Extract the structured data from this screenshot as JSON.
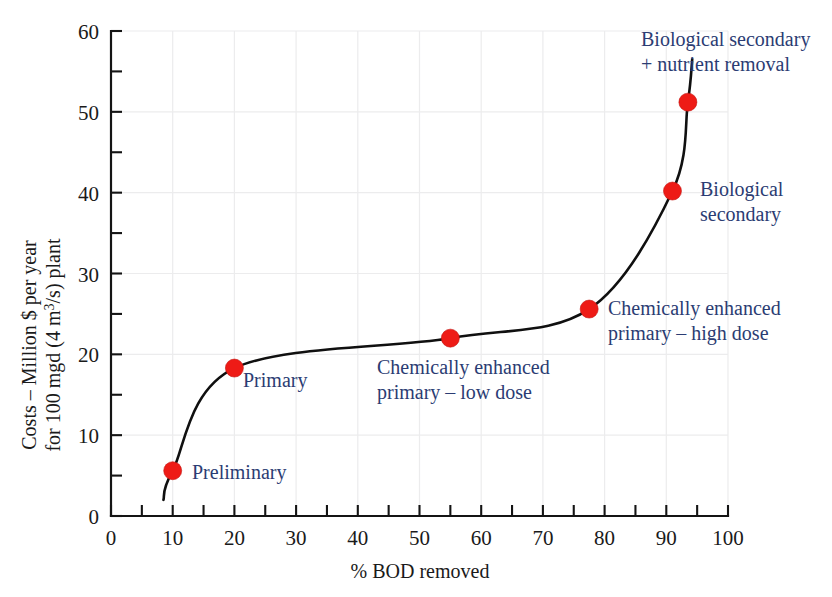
{
  "chart_data": {
    "type": "line",
    "title": "",
    "xlabel": "% BOD removed",
    "ylabel_line1": "Costs – Million $ per year",
    "ylabel_line2": "for 100 mgd (4 m³/s) plant",
    "xlim": [
      0,
      100
    ],
    "ylim": [
      0,
      60
    ],
    "x_major_ticks": [
      0,
      10,
      20,
      30,
      40,
      50,
      60,
      70,
      80,
      90,
      100
    ],
    "x_minor_ticks": [
      5,
      15,
      25,
      35,
      45,
      55,
      65,
      75,
      85,
      95
    ],
    "y_major_ticks": [
      0,
      10,
      20,
      30,
      40,
      50,
      60
    ],
    "y_minor_ticks": [
      5,
      15,
      25,
      35,
      45,
      55
    ],
    "x_tick_labels": [
      "0",
      "10",
      "20",
      "30",
      "40",
      "50",
      "60",
      "70",
      "80",
      "90",
      "100"
    ],
    "y_tick_labels": [
      "0",
      "10",
      "20",
      "30",
      "40",
      "50",
      "60"
    ],
    "grid": true,
    "grid_color": "#ececed",
    "legend": "none",
    "marker_color": "#ee1b16",
    "line_color": "#101010",
    "annotation_color": "#2b3c73",
    "x": [
      10,
      20,
      55,
      77.5,
      91,
      93.5
    ],
    "values": [
      5.6,
      18.3,
      22.0,
      25.6,
      40.2,
      51.2
    ],
    "points": [
      {
        "label": "Preliminary",
        "x": 10,
        "y": 5.6
      },
      {
        "label": "Primary",
        "x": 20,
        "y": 18.3
      },
      {
        "label": "Chemically enhanced primary – low dose",
        "x": 55,
        "y": 22.0
      },
      {
        "label": "Chemically enhanced primary – high dose",
        "x": 77.5,
        "y": 25.6
      },
      {
        "label": "Biological secondary",
        "x": 91,
        "y": 40.2
      },
      {
        "label": "Biological secondary + nutrient removal",
        "x": 93.5,
        "y": 51.2
      }
    ],
    "annotations": [
      {
        "name": "preliminary",
        "lines": [
          "Preliminary"
        ]
      },
      {
        "name": "primary",
        "lines": [
          "Primary"
        ]
      },
      {
        "name": "cep-low-dose",
        "lines": [
          "Chemically enhanced",
          "primary – low dose"
        ]
      },
      {
        "name": "cep-high-dose",
        "lines": [
          "Chemically enhanced",
          "primary – high dose"
        ]
      },
      {
        "name": "biological-secondary",
        "lines": [
          "Biological",
          "secondary"
        ]
      },
      {
        "name": "biological-secondary-nutrient",
        "lines": [
          "Biological secondary",
          "+ nutrient removal"
        ]
      }
    ]
  },
  "axis": {
    "x_title": "% BOD removed",
    "y_title_line1": "Costs – Million $ per year",
    "y_title_line2": "for 100 mgd (4 m³/s) plant",
    "y_unit_sup": "3"
  },
  "ticks": {
    "x": [
      "0",
      "10",
      "20",
      "30",
      "40",
      "50",
      "60",
      "70",
      "80",
      "90",
      "100"
    ],
    "y": [
      "0",
      "10",
      "20",
      "30",
      "40",
      "50",
      "60"
    ]
  },
  "annotations": {
    "preliminary": "Preliminary",
    "primary": "Primary",
    "cep_low_l1": "Chemically enhanced",
    "cep_low_l2": "primary – low dose",
    "cep_high_l1": "Chemically enhanced",
    "cep_high_l2": "primary – high dose",
    "bio_sec_l1": "Biological",
    "bio_sec_l2": "secondary",
    "bio_nut_l1": "Biological secondary",
    "bio_nut_l2": "+ nutrient removal"
  }
}
